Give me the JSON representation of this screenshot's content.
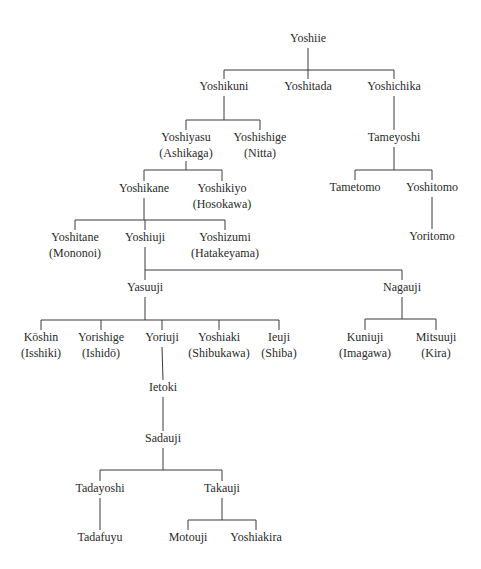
{
  "diagram": {
    "title": "",
    "nodes": [
      {
        "id": "yoshiie",
        "name": "Yoshiie",
        "clan": ""
      },
      {
        "id": "yoshikuni",
        "name": "Yoshikuni",
        "clan": ""
      },
      {
        "id": "yoshitada",
        "name": "Yoshitada",
        "clan": ""
      },
      {
        "id": "yoshichika",
        "name": "Yoshichika",
        "clan": ""
      },
      {
        "id": "yoshiyasu",
        "name": "Yoshiyasu",
        "clan": "(Ashikaga)"
      },
      {
        "id": "yoshishige",
        "name": "Yoshishige",
        "clan": "(Nitta)"
      },
      {
        "id": "tameyoshi",
        "name": "Tameyoshi",
        "clan": ""
      },
      {
        "id": "yoshikane",
        "name": "Yoshikane",
        "clan": ""
      },
      {
        "id": "yoshikiyo",
        "name": "Yoshikiyo",
        "clan": "(Hosokawa)"
      },
      {
        "id": "tametomo",
        "name": "Tametomo",
        "clan": ""
      },
      {
        "id": "yoshitomo",
        "name": "Yoshitomo",
        "clan": ""
      },
      {
        "id": "yoritomo",
        "name": "Yoritomo",
        "clan": ""
      },
      {
        "id": "yoshitane",
        "name": "Yoshitane",
        "clan": "(Mononoi)"
      },
      {
        "id": "yoshiuji",
        "name": "Yoshiuji",
        "clan": ""
      },
      {
        "id": "yoshizumi",
        "name": "Yoshizumi",
        "clan": "(Hatakeyama)"
      },
      {
        "id": "yasuuji",
        "name": "Yasuuji",
        "clan": ""
      },
      {
        "id": "nagauji",
        "name": "Nagauji",
        "clan": ""
      },
      {
        "id": "koshin",
        "name": "Kōshin",
        "clan": "(Isshiki)"
      },
      {
        "id": "yorishige",
        "name": "Yorishige",
        "clan": "(Ishidō)"
      },
      {
        "id": "yoriuji",
        "name": "Yoriuji",
        "clan": ""
      },
      {
        "id": "yoshiaki",
        "name": "Yoshiaki",
        "clan": "(Shibukawa)"
      },
      {
        "id": "ieuji",
        "name": "Ieuji",
        "clan": "(Shiba)"
      },
      {
        "id": "kuniuji",
        "name": "Kuniuji",
        "clan": "(Imagawa)"
      },
      {
        "id": "mitsuuji",
        "name": "Mitsuuji",
        "clan": "(Kira)"
      },
      {
        "id": "ietoki",
        "name": "Ietoki",
        "clan": ""
      },
      {
        "id": "sadauji",
        "name": "Sadauji",
        "clan": ""
      },
      {
        "id": "tadayoshi",
        "name": "Tadayoshi",
        "clan": ""
      },
      {
        "id": "takauji",
        "name": "Takauji",
        "clan": ""
      },
      {
        "id": "tadafuyu",
        "name": "Tadafuyu",
        "clan": ""
      },
      {
        "id": "motouji",
        "name": "Motouji",
        "clan": ""
      },
      {
        "id": "yoshiakira",
        "name": "Yoshiakira",
        "clan": ""
      }
    ],
    "edges": [
      {
        "parent": "yoshiie",
        "children": [
          "yoshikuni",
          "yoshitada",
          "yoshichika"
        ]
      },
      {
        "parent": "yoshikuni",
        "children": [
          "yoshiyasu",
          "yoshishige"
        ]
      },
      {
        "parent": "yoshichika",
        "children": [
          "tameyoshi"
        ]
      },
      {
        "parent": "yoshiyasu",
        "children": [
          "yoshikane",
          "yoshikiyo"
        ]
      },
      {
        "parent": "tameyoshi",
        "children": [
          "tametomo",
          "yoshitomo"
        ]
      },
      {
        "parent": "yoshitomo",
        "children": [
          "yoritomo"
        ]
      },
      {
        "parent": "yoshikane",
        "children": [
          "yoshitane",
          "yoshiuji",
          "yoshizumi"
        ]
      },
      {
        "parent": "yoshiuji",
        "children": [
          "yasuuji",
          "nagauji"
        ]
      },
      {
        "parent": "yasuuji",
        "children": [
          "koshin",
          "yorishige",
          "yoriuji",
          "yoshiaki",
          "ieuji"
        ]
      },
      {
        "parent": "nagauji",
        "children": [
          "kuniuji",
          "mitsuuji"
        ]
      },
      {
        "parent": "yoriuji",
        "children": [
          "ietoki"
        ]
      },
      {
        "parent": "ietoki",
        "children": [
          "sadauji"
        ]
      },
      {
        "parent": "sadauji",
        "children": [
          "tadayoshi",
          "takauji"
        ]
      },
      {
        "parent": "tadayoshi",
        "children": [
          "tadafuyu"
        ]
      },
      {
        "parent": "takauji",
        "children": [
          "motouji",
          "yoshiakira"
        ]
      }
    ]
  }
}
